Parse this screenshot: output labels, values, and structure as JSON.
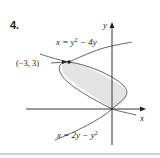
{
  "problem": {
    "number": "4."
  },
  "axes": {
    "x_label": "x",
    "y_label": "y"
  },
  "curves": [
    {
      "equation_lhs": "x = y",
      "sup": "2",
      "equation_rhs": " − 4y",
      "full": "x = y² − 4y"
    },
    {
      "equation_lhs": "x = 2y − y",
      "sup": "2",
      "equation_rhs": "",
      "full": "x = 2y − y²"
    }
  ],
  "point": {
    "label": "(−3, 3)",
    "x": -3,
    "y": 3
  },
  "colors": {
    "ink": "#231f20",
    "region_fill": "#e3e3e3",
    "curve": "#555555"
  }
}
